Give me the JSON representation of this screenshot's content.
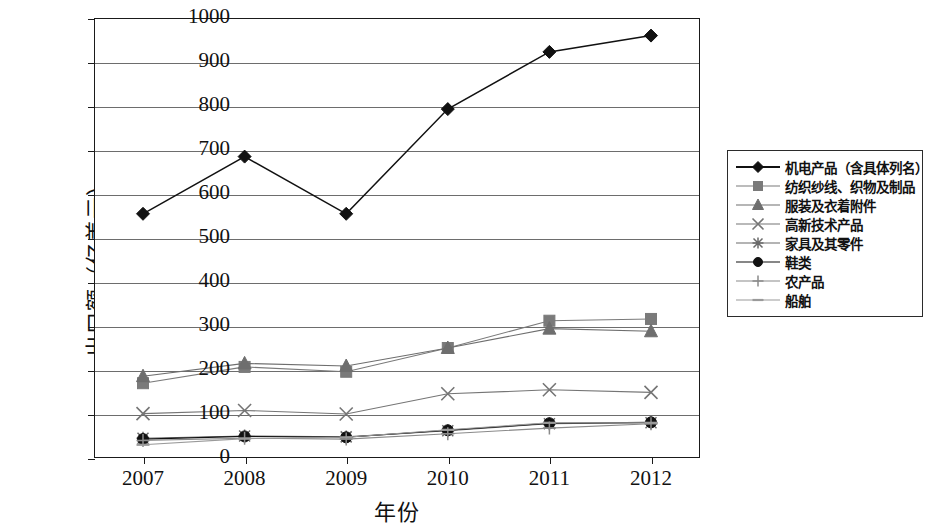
{
  "chart_data": {
    "type": "line",
    "title": "",
    "xlabel": "年份",
    "ylabel": "出口额（亿美元）",
    "categories": [
      "2007",
      "2008",
      "2009",
      "2010",
      "2011",
      "2012"
    ],
    "x": [
      2007,
      2008,
      2009,
      2010,
      2011,
      2012
    ],
    "ylim": [
      0,
      1000
    ],
    "xlim": [
      2007,
      2012
    ],
    "y_ticks": [
      "0",
      "100",
      "200",
      "300",
      "400",
      "500",
      "600",
      "700",
      "800",
      "900",
      "1000"
    ],
    "y_tick_values": [
      0,
      100,
      200,
      300,
      400,
      500,
      600,
      700,
      800,
      900,
      1000
    ],
    "grid": "horizontal",
    "legend_position": "right-outside",
    "series": [
      {
        "name": "机电产品（含具体列名）",
        "marker": "diamond",
        "color": "#111111",
        "values": [
          555,
          685,
          555,
          793,
          923,
          960
        ]
      },
      {
        "name": "纺织纱线、织物及制品",
        "marker": "square",
        "color": "#7a7a7a",
        "values": [
          170,
          207,
          196,
          250,
          312,
          316
        ]
      },
      {
        "name": "服装及衣着附件",
        "marker": "triangle",
        "color": "#6e6e6e",
        "values": [
          186,
          215,
          209,
          250,
          294,
          288
        ]
      },
      {
        "name": "高新技术产品",
        "marker": "x",
        "color": "#757575",
        "values": [
          101,
          108,
          100,
          146,
          155,
          149
        ]
      },
      {
        "name": "家具及其零件",
        "marker": "asterisk",
        "color": "#6a6a6a",
        "values": [
          45,
          50,
          48,
          62,
          78,
          80
        ]
      },
      {
        "name": "鞋类",
        "marker": "circle",
        "color": "#111111",
        "values": [
          43,
          49,
          47,
          63,
          79,
          81
        ]
      },
      {
        "name": "农产品",
        "marker": "plus",
        "color": "#8a8a8a",
        "values": [
          40,
          45,
          43,
          55,
          68,
          78
        ]
      },
      {
        "name": "船舶",
        "marker": "dash",
        "color": "#9a9a9a",
        "values": [
          30,
          44,
          47,
          64,
          80,
          80
        ]
      }
    ]
  },
  "legend": {
    "items": [
      {
        "label": "机电产品（含具体列名）"
      },
      {
        "label": "纺织纱线、织物及制品"
      },
      {
        "label": "服装及衣着附件"
      },
      {
        "label": "高新技术产品"
      },
      {
        "label": "家具及其零件"
      },
      {
        "label": "鞋类"
      },
      {
        "label": "农产品"
      },
      {
        "label": "船舶"
      }
    ]
  },
  "axes": {
    "x_title": "年份",
    "y_title": "出口额（亿美元）"
  }
}
